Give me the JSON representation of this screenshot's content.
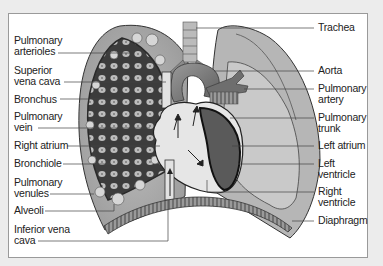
{
  "diagram": {
    "type": "anatomical-illustration",
    "left_labels": [
      {
        "line1": "Pulmonary",
        "line2": "arterioles"
      },
      {
        "line1": "Superior",
        "line2": "vena cava"
      },
      {
        "line1": "Bronchus",
        "line2": ""
      },
      {
        "line1": "Pulmonary",
        "line2": "vein"
      },
      {
        "line1": "Right atrium",
        "line2": ""
      },
      {
        "line1": "Bronchiole",
        "line2": ""
      },
      {
        "line1": "Pulmonary",
        "line2": "venules"
      },
      {
        "line1": "Alveoli",
        "line2": ""
      },
      {
        "line1": "Inferior vena",
        "line2": "cava"
      }
    ],
    "right_labels": [
      {
        "line1": "Trachea",
        "line2": ""
      },
      {
        "line1": "Aorta",
        "line2": ""
      },
      {
        "line1": "Pulmonary",
        "line2": "artery"
      },
      {
        "line1": "Pulmonary",
        "line2": "trunk"
      },
      {
        "line1": "Left atrium",
        "line2": ""
      },
      {
        "line1": "Left",
        "line2": "ventricle"
      },
      {
        "line1": "Right",
        "line2": "ventricle"
      },
      {
        "line1": "Diaphragm",
        "line2": ""
      }
    ],
    "colors": {
      "background": "#ececec",
      "panel": "#ffffff",
      "lung": "#a9a9a9",
      "lung_light": "#c8c8c8",
      "network": "#3a3a3a",
      "heart": "#e4e4e4",
      "ventricle_dark": "#555555",
      "leader_line": "#555555"
    }
  }
}
